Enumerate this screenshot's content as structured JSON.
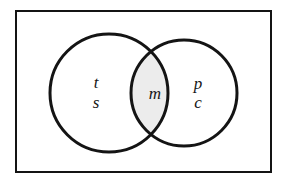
{
  "diagram": {
    "type": "venn-diagram",
    "universe": {
      "shape": "rectangle",
      "label": "",
      "border_color": "#141414",
      "fill_color": "#ffffff",
      "border_width": 2,
      "x": 16,
      "y": 11,
      "width": 255,
      "height": 161
    },
    "sets": [
      {
        "id": "left-set",
        "name": "left-circle",
        "cx": 109,
        "cy": 93,
        "r": 59,
        "fill_color": "#ffffff",
        "stroke_color": "#141414",
        "stroke_width": 3
      },
      {
        "id": "right-set",
        "name": "right-circle",
        "cx": 184,
        "cy": 93,
        "r": 53,
        "fill_color": "#ffffff",
        "stroke_color": "#141414",
        "stroke_width": 3
      }
    ],
    "intersection": {
      "id": "lens-region",
      "name": "intersection-region",
      "fill_color": "#ececec",
      "top_point_x": 155,
      "top_point_y": 47,
      "bottom_point_x": 155,
      "bottom_point_y": 138
    },
    "labels": [
      {
        "id": "label-t",
        "text": "t",
        "region": "left-only",
        "x": 96,
        "y": 84,
        "font_size": 17
      },
      {
        "id": "label-s",
        "text": "s",
        "region": "left-only",
        "x": 96,
        "y": 104,
        "font_size": 17
      },
      {
        "id": "label-m",
        "text": "m",
        "region": "intersection",
        "x": 155,
        "y": 95,
        "font_size": 17
      },
      {
        "id": "label-p",
        "text": "p",
        "region": "right-only",
        "x": 198,
        "y": 85,
        "font_size": 17
      },
      {
        "id": "label-c",
        "text": "c",
        "region": "right-only",
        "x": 198,
        "y": 104,
        "font_size": 17
      }
    ]
  }
}
